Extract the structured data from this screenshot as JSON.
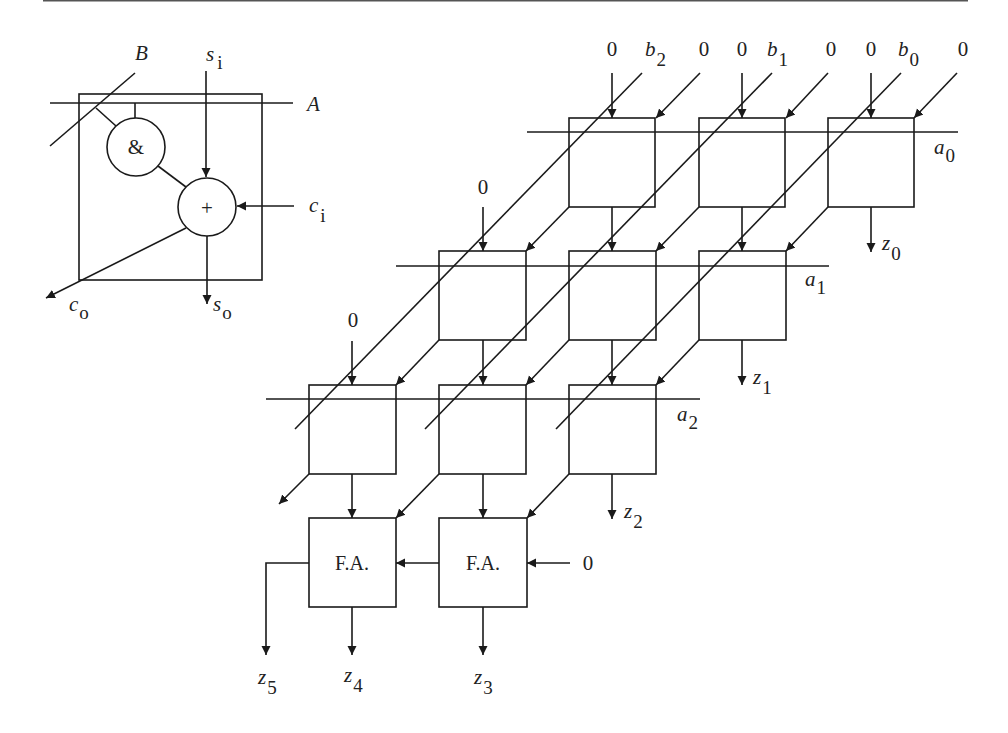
{
  "figure": {
    "colors": {
      "stroke": "#1a1a1a",
      "text": "#222222",
      "background": "#ffffff"
    }
  },
  "cell_legend": {
    "input_a": "A",
    "input_b": "B",
    "sum_in_base": "s",
    "sum_in_sub": "i",
    "carry_in_base": "c",
    "carry_in_sub": "i",
    "carry_out_base": "c",
    "carry_out_sub": "o",
    "sum_out_base": "s",
    "sum_out_sub": "o",
    "and_gate_symbol": "&",
    "adder_symbol": "+"
  },
  "array": {
    "top_inputs": [
      {
        "zero": "0",
        "b_base": "b",
        "b_sub": "2",
        "carry_zero": "0"
      },
      {
        "zero": "0",
        "b_base": "b",
        "b_sub": "1",
        "carry_zero": "0"
      },
      {
        "zero": "0",
        "b_base": "b",
        "b_sub": "0",
        "carry_zero": "0"
      }
    ],
    "row_inputs": [
      {
        "base": "a",
        "sub": "0"
      },
      {
        "base": "a",
        "sub": "1"
      },
      {
        "base": "a",
        "sub": "2"
      }
    ],
    "row_zero_inputs": [
      "0",
      "0"
    ],
    "outputs": [
      {
        "base": "z",
        "sub": "0"
      },
      {
        "base": "z",
        "sub": "1"
      },
      {
        "base": "z",
        "sub": "2"
      },
      {
        "base": "z",
        "sub": "3"
      },
      {
        "base": "z",
        "sub": "4"
      },
      {
        "base": "z",
        "sub": "5"
      }
    ],
    "full_adders": [
      {
        "label": "F.A."
      },
      {
        "label": "F.A."
      }
    ],
    "fa_carry_in": "0"
  }
}
